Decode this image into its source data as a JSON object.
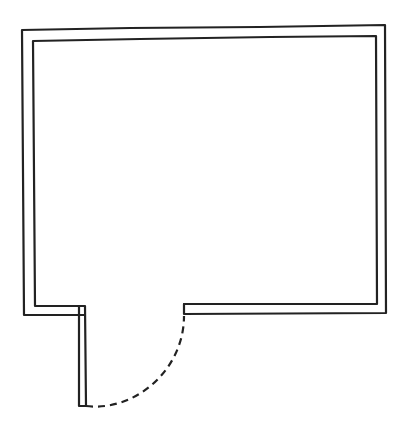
{
  "diagram": {
    "type": "floor-plan",
    "colors": {
      "background": "#ffffff",
      "line": "#222222"
    },
    "elements": {
      "room": {
        "label": ""
      },
      "door": {
        "label": ""
      }
    }
  }
}
